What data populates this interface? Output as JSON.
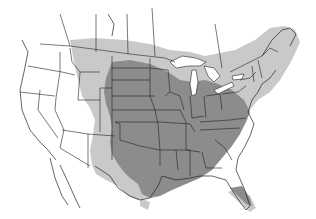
{
  "map": {
    "title": "",
    "type": "range-map",
    "region": "North America (contiguous United States and southern Canada)",
    "background_color": "#ffffff",
    "border_color": "#222222",
    "legend": [
      {
        "name": "primary-range",
        "color": "#8c8c8c"
      },
      {
        "name": "peripheral-range",
        "color": "#c9c9c9"
      },
      {
        "name": "outside-range",
        "color": "#ffffff"
      }
    ]
  }
}
